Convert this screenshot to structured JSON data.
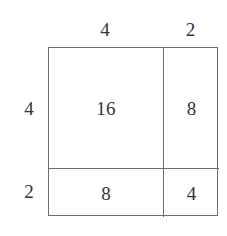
{
  "diagram": {
    "type": "area-model-rectangle",
    "title": "",
    "colors": {
      "line": "#6e6e6e",
      "text": "#343434",
      "background": "#ffffff"
    },
    "top_labels": [
      {
        "value": "4",
        "name": "top-dimension-left"
      },
      {
        "value": "2",
        "name": "top-dimension-right"
      }
    ],
    "left_labels": [
      {
        "value": "4",
        "name": "left-dimension-top"
      },
      {
        "value": "2",
        "name": "left-dimension-bottom"
      }
    ],
    "cells": [
      {
        "row": 0,
        "col": 0,
        "value": "16"
      },
      {
        "row": 0,
        "col": 1,
        "value": "8"
      },
      {
        "row": 1,
        "col": 0,
        "value": "8"
      },
      {
        "row": 1,
        "col": 1,
        "value": "4"
      }
    ]
  }
}
